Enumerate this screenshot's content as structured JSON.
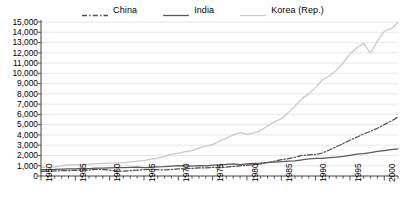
{
  "chart_data": {
    "type": "line",
    "title": "",
    "subtitle": "",
    "xlabel": "",
    "ylabel": "",
    "xlim": [
      1950,
      2002
    ],
    "ylim": [
      0,
      15000
    ],
    "y_tick_step": 1000,
    "x_tick_step_major": 5,
    "x_tick_step_minor": 1,
    "grid": "horizontal",
    "legend_position": "top-center",
    "ytick_labels": [
      "0",
      "1,000",
      "2,000",
      "3,000",
      "4,000",
      "5,000",
      "6,000",
      "7,000",
      "8,000",
      "9,000",
      "10,000",
      "11,000",
      "12,000",
      "13,000",
      "14,000",
      "15,000"
    ],
    "ytick_values": [
      0,
      1000,
      2000,
      3000,
      4000,
      5000,
      6000,
      7000,
      8000,
      9000,
      10000,
      11000,
      12000,
      13000,
      14000,
      15000
    ],
    "xtick_labels": [
      "1950",
      "1955",
      "1960",
      "1965",
      "1970",
      "1975",
      "1980",
      "1985",
      "1990",
      "1995",
      "2000"
    ],
    "xtick_values": [
      1950,
      1955,
      1960,
      1965,
      1970,
      1975,
      1980,
      1985,
      1990,
      1995,
      2000
    ],
    "x": [
      1950,
      1951,
      1952,
      1953,
      1954,
      1955,
      1956,
      1957,
      1958,
      1959,
      1960,
      1961,
      1962,
      1963,
      1964,
      1965,
      1966,
      1967,
      1968,
      1969,
      1970,
      1971,
      1972,
      1973,
      1974,
      1975,
      1976,
      1977,
      1978,
      1979,
      1980,
      1981,
      1982,
      1983,
      1984,
      1985,
      1986,
      1987,
      1988,
      1989,
      1990,
      1991,
      1992,
      1993,
      1994,
      1995,
      1996,
      1997,
      1998,
      1999,
      2000,
      2001,
      2002
    ],
    "series": [
      {
        "name": "China",
        "color": "#4d4d4d",
        "style": "dash-dot",
        "values": [
          450,
          470,
          500,
          520,
          530,
          545,
          575,
          580,
          640,
          630,
          570,
          470,
          480,
          520,
          570,
          615,
          650,
          610,
          600,
          640,
          700,
          730,
          740,
          780,
          790,
          830,
          820,
          860,
          930,
          990,
          1050,
          1100,
          1190,
          1290,
          1440,
          1590,
          1690,
          1830,
          2000,
          2050,
          2090,
          2240,
          2530,
          2850,
          3150,
          3480,
          3780,
          4100,
          4350,
          4650,
          5000,
          5350,
          5750
        ]
      },
      {
        "name": "India",
        "color": "#595959",
        "style": "solid",
        "values": [
          620,
          630,
          640,
          665,
          690,
          705,
          735,
          715,
          760,
          765,
          800,
          815,
          815,
          840,
          860,
          820,
          840,
          900,
          915,
          960,
          1000,
          990,
          970,
          1000,
          990,
          1070,
          1060,
          1130,
          1180,
          1110,
          1180,
          1230,
          1250,
          1320,
          1360,
          1400,
          1440,
          1470,
          1580,
          1660,
          1720,
          1720,
          1780,
          1830,
          1910,
          2010,
          2120,
          2180,
          2280,
          2400,
          2480,
          2570,
          2650
        ]
      },
      {
        "name": "Korea (Rep.)",
        "color": "#c9c9c9",
        "style": "solid",
        "values": [
          860,
          800,
          860,
          1010,
          1070,
          1110,
          1110,
          1160,
          1200,
          1230,
          1250,
          1280,
          1280,
          1380,
          1440,
          1490,
          1640,
          1730,
          1910,
          2110,
          2230,
          2380,
          2470,
          2740,
          2920,
          3060,
          3400,
          3680,
          4000,
          4220,
          4050,
          4190,
          4430,
          4870,
          5280,
          5580,
          6150,
          6820,
          7540,
          8000,
          8630,
          9350,
          9770,
          10260,
          11020,
          11880,
          12490,
          12920,
          11980,
          13130,
          14080,
          14350,
          14980
        ]
      }
    ]
  }
}
